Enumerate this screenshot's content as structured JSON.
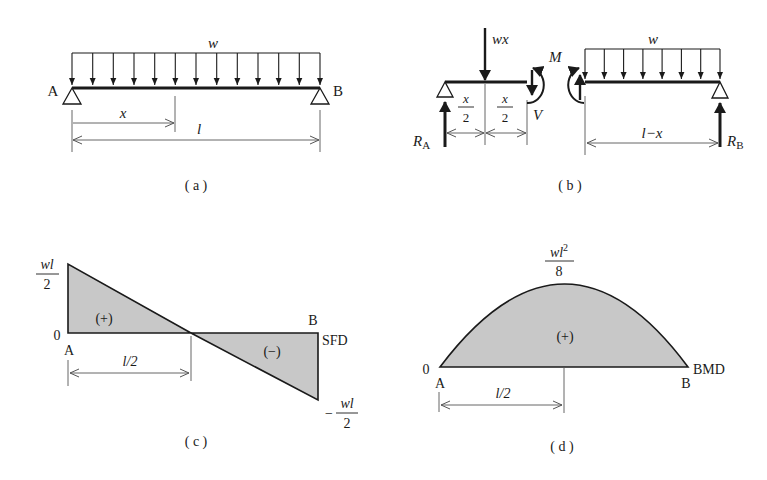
{
  "panels": {
    "a": {
      "caption": "( a )",
      "load_label": "w",
      "left_support": "A",
      "right_support": "B",
      "dim_x": "x",
      "dim_l": "l",
      "load_arrow_count": 13
    },
    "b": {
      "caption": "( b )",
      "point_load": "wx",
      "half_x_num": "x",
      "half_x_den": "2",
      "shear": "V",
      "moment": "M",
      "reaction_a": "R",
      "reaction_a_sub": "A",
      "reaction_b": "R",
      "reaction_b_sub": "B",
      "load_label": "w",
      "dim_right": "l−x"
    },
    "c": {
      "caption": "( c )",
      "top_value_num": "wl",
      "top_value_den": "2",
      "zero": "0",
      "left_end": "A",
      "right_end": "B",
      "diagram_label": "SFD",
      "positive_sign": "(+)",
      "negative_sign": "(−)",
      "dim_half": "l/2",
      "bottom_value_sign": "−",
      "bottom_value_num": "wl",
      "bottom_value_den": "2"
    },
    "d": {
      "caption": "( d )",
      "peak_num": "wl",
      "peak_num_sup": "2",
      "peak_den": "8",
      "zero": "0",
      "left_end": "A",
      "right_end": "B",
      "diagram_label": "BMD",
      "positive_sign": "(+)",
      "dim_half": "l/2"
    }
  },
  "colors": {
    "ink": "#1a1a1a",
    "dim_line": "#555555",
    "fill": "#c8c8c8"
  }
}
